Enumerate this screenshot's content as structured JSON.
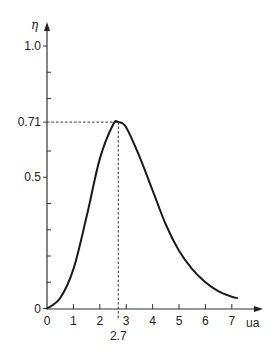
{
  "chart_data": {
    "type": "line",
    "title": "",
    "xlabel": "ua",
    "ylabel": "η",
    "xlim": [
      0,
      7.5
    ],
    "ylim": [
      0,
      1.05
    ],
    "grid": false,
    "legend": null,
    "x_ticks": [
      0,
      1,
      2,
      3,
      4,
      5,
      6,
      7
    ],
    "x_tick_labels": [
      "0",
      "1",
      "2",
      "3",
      "4",
      "5",
      "6",
      "7"
    ],
    "y_ticks_minor": [
      0.1,
      0.2,
      0.3,
      0.4,
      0.6,
      0.7,
      0.8,
      0.9
    ],
    "y_ticks_labeled": [
      0,
      0.5,
      0.71,
      1.0
    ],
    "y_tick_labels": [
      "0",
      "0.5",
      "0.71",
      "1.0"
    ],
    "series": [
      {
        "name": "η(ua)",
        "x": [
          0,
          0.5,
          1.0,
          1.5,
          2.0,
          2.5,
          2.7,
          3.0,
          3.5,
          4.0,
          4.5,
          5.0,
          5.5,
          6.0,
          6.5,
          7.0,
          7.2
        ],
        "values": [
          0,
          0.04,
          0.15,
          0.35,
          0.57,
          0.7,
          0.71,
          0.69,
          0.58,
          0.45,
          0.32,
          0.22,
          0.15,
          0.1,
          0.065,
          0.045,
          0.04
        ]
      }
    ],
    "annotations": [
      {
        "type": "dashed-guide",
        "x": 2.7,
        "y": 0.71,
        "x_label": "2.7",
        "y_label": "0.71",
        "text": "maximum"
      }
    ]
  },
  "labels": {
    "y_axis": "η",
    "x_axis": "ua",
    "peak_x": "2.7",
    "peak_y": "0.71"
  }
}
